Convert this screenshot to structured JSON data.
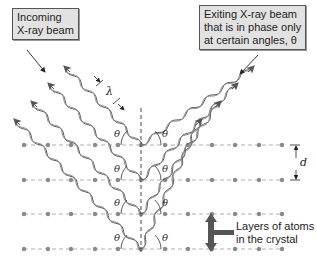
{
  "diagram": {
    "type": "bragg-xray-diffraction",
    "callouts": {
      "incoming": {
        "line1": "Incoming",
        "line2": "X-ray beam"
      },
      "exiting": {
        "line1": "Exiting X-ray beam",
        "line2": "that is in phase only",
        "line3": "at certain angles, θ"
      }
    },
    "layers_label": {
      "line1": "Layers of atoms",
      "line2": "in the crystal"
    },
    "symbols": {
      "lambda": "λ",
      "d": "d",
      "theta": "θ"
    },
    "atom_rows_y": [
      145,
      180,
      214,
      249
    ],
    "atom_x": [
      24,
      48,
      71,
      95,
      118,
      141,
      165,
      188,
      212,
      235,
      259,
      282
    ],
    "normal_line_x": 141,
    "colors": {
      "atom": "#8a8a8a",
      "wave": "#555555",
      "callout_bg": "#e2e2e2",
      "arrow_fill": "#555555"
    }
  }
}
